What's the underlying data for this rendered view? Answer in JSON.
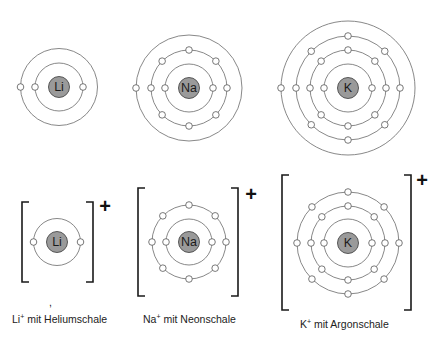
{
  "colors": {
    "shell": "#6a6a6a",
    "nucleus_fill": "#9a9a9a",
    "nucleus_stroke": "#4a4a4a",
    "electron_fill": "#ffffff",
    "electron_stroke": "#555555",
    "text": "#222222"
  },
  "atoms": [
    {
      "id": "li-atom",
      "symbol": "Li",
      "cx": 59,
      "cy": 87,
      "shells": [
        {
          "r": 24,
          "electrons": 2
        },
        {
          "r": 38.5,
          "electrons": 1
        }
      ]
    },
    {
      "id": "na-atom",
      "symbol": "Na",
      "cx": 189,
      "cy": 88,
      "shells": [
        {
          "r": 24,
          "electrons": 2
        },
        {
          "r": 38,
          "electrons": 8
        },
        {
          "r": 53,
          "electrons": 1
        }
      ]
    },
    {
      "id": "k-atom",
      "symbol": "K",
      "cx": 348,
      "cy": 88,
      "shells": [
        {
          "r": 24,
          "electrons": 2
        },
        {
          "r": 38,
          "electrons": 8
        },
        {
          "r": 52,
          "electrons": 8
        },
        {
          "r": 67,
          "electrons": 1
        }
      ]
    }
  ],
  "ions": [
    {
      "id": "li-ion",
      "symbol": "Li",
      "cx": 57,
      "cy": 242,
      "shells": [
        {
          "r": 23.5,
          "electrons": 2
        }
      ],
      "bracket": {
        "left": 22,
        "right": 93,
        "top": 202,
        "bottom": 282
      },
      "charge": "+",
      "charge_x": 105,
      "charge_y": 213,
      "label": {
        "base": "Li",
        "sup": "+",
        "rest": " mit Heliumschale",
        "x": 12,
        "y": 313
      }
    },
    {
      "id": "na-ion",
      "symbol": "Na",
      "cx": 189,
      "cy": 242,
      "shells": [
        {
          "r": 23,
          "electrons": 2
        },
        {
          "r": 37,
          "electrons": 8
        }
      ],
      "bracket": {
        "left": 138,
        "right": 238,
        "top": 188,
        "bottom": 296
      },
      "charge": "+",
      "charge_x": 251,
      "charge_y": 201,
      "label": {
        "base": "Na",
        "sup": "+",
        "rest": " mit Neonschale",
        "x": 143,
        "y": 313
      }
    },
    {
      "id": "k-ion",
      "symbol": "K",
      "cx": 348,
      "cy": 243,
      "shells": [
        {
          "r": 24,
          "electrons": 2
        },
        {
          "r": 37,
          "electrons": 8
        },
        {
          "r": 51,
          "electrons": 8
        }
      ],
      "bracket": {
        "left": 282,
        "right": 411,
        "top": 175,
        "bottom": 310
      },
      "charge": "+",
      "charge_x": 422,
      "charge_y": 187,
      "label": {
        "base": "K",
        "sup": "+",
        "rest": " mit Argonschale",
        "x": 300,
        "y": 318
      }
    }
  ],
  "stray_mark": {
    "text": ",",
    "x": 49,
    "y": 296
  }
}
